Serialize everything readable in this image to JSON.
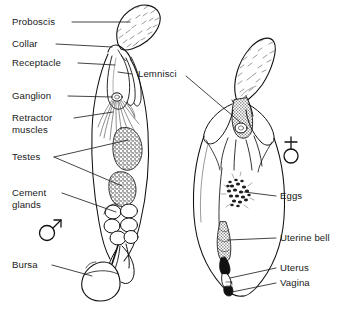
{
  "figure": {
    "background": "#ffffff",
    "ink": "#111111",
    "leader_color": "#222222"
  },
  "symbols": {
    "male": {
      "name": "male-symbol",
      "glyph": "♂",
      "x": 44,
      "y": 228
    },
    "female": {
      "name": "female-symbol",
      "glyph": "♀",
      "x": 288,
      "y": 150
    }
  },
  "labels_left": [
    {
      "key": "proboscis",
      "text": "Proboscis",
      "x": 12,
      "y": 16
    },
    {
      "key": "collar",
      "text": "Collar",
      "x": 12,
      "y": 38
    },
    {
      "key": "receptacle",
      "text": "Receptacle",
      "x": 12,
      "y": 57
    },
    {
      "key": "ganglion",
      "text": "Ganglion",
      "x": 12,
      "y": 90
    },
    {
      "key": "retractor",
      "text": "Retractor",
      "x": 12,
      "y": 112
    },
    {
      "key": "muscles",
      "text": "muscles",
      "x": 12,
      "y": 124
    },
    {
      "key": "testes",
      "text": "Testes",
      "x": 12,
      "y": 151
    },
    {
      "key": "cement",
      "text": "Cement",
      "x": 12,
      "y": 187
    },
    {
      "key": "glands",
      "text": "glands",
      "x": 12,
      "y": 199
    },
    {
      "key": "bursa",
      "text": "Bursa",
      "x": 12,
      "y": 259
    }
  ],
  "labels_right": [
    {
      "key": "eggs",
      "text": "Eggs",
      "x": 280,
      "y": 190
    },
    {
      "key": "uterine_bell",
      "text": "Uterine bell",
      "x": 280,
      "y": 232
    },
    {
      "key": "uterus",
      "text": "Uterus",
      "x": 280,
      "y": 262
    },
    {
      "key": "vagina",
      "text": "Vagina",
      "x": 280,
      "y": 277
    }
  ],
  "labels_center": [
    {
      "key": "lemnisci",
      "text": "Lemnisci",
      "x": 138,
      "y": 68
    }
  ],
  "structures": {
    "male": [
      "proboscis",
      "collar",
      "receptacle",
      "ganglion",
      "retractor-muscles",
      "lemnisci",
      "testes",
      "cement-glands",
      "bursa"
    ],
    "female": [
      "proboscis",
      "receptacle",
      "lemnisci",
      "ganglion",
      "eggs",
      "uterine-bell",
      "uterus",
      "vagina"
    ]
  }
}
